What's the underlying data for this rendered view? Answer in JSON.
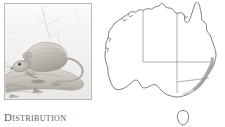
{
  "figure": {
    "caption": {
      "text": "Distribution",
      "initial": "D",
      "rest": "ISTRIBUTION"
    },
    "background_color": "#ffffff"
  },
  "photo": {
    "subject": "rodent-on-log",
    "description": "Grey-brown native rodent resting on a fallen log",
    "style": "grayscale-photograph",
    "border_color": "#b9b9b9",
    "tones": {
      "background": "#f4f4f4",
      "fur_light": "#d8d4cf",
      "fur_mid": "#b3aea8",
      "fur_dark": "#8e8982",
      "log": "#c9c5bf",
      "shadow": "#9b9792"
    }
  },
  "map": {
    "region": "Australia",
    "outline_color": "#6e6e6e",
    "state_border_color": "#8d8d8d",
    "range_color": "#9a9a9a",
    "land_fill": "#ffffff",
    "states": [
      {
        "code": "WA",
        "name": "Western Australia"
      },
      {
        "code": "NT",
        "name": "Northern Territory"
      },
      {
        "code": "SA",
        "name": "South Australia"
      },
      {
        "code": "QLD",
        "name": "Queensland"
      },
      {
        "code": "NSW",
        "name": "New South Wales"
      },
      {
        "code": "VIC",
        "name": "Victoria"
      },
      {
        "code": "TAS",
        "name": "Tasmania"
      }
    ],
    "range_description": "Narrow coastal band along the south-east coast of New South Wales and eastern Victoria"
  }
}
